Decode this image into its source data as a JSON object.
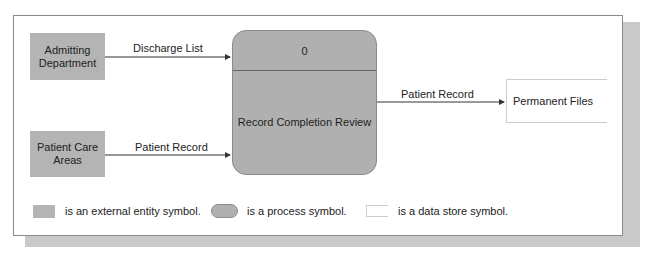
{
  "diagram": {
    "type": "data-flow-diagram",
    "external_entities": [
      {
        "id": "admitting",
        "label_line1": "Admitting",
        "label_line2": "Department"
      },
      {
        "id": "patient-care",
        "label_line1": "Patient Care",
        "label_line2": "Areas"
      }
    ],
    "process": {
      "number": "0",
      "name": "Record Completion Review"
    },
    "data_store": {
      "name": "Permanent Files"
    },
    "flows": [
      {
        "from": "Admitting Department",
        "to": "Record Completion Review",
        "label": "Discharge List"
      },
      {
        "from": "Patient Care Areas",
        "to": "Record Completion Review",
        "label": "Patient Record"
      },
      {
        "from": "Record Completion Review",
        "to": "Permanent Files",
        "label": "Patient Record"
      }
    ],
    "legend": [
      {
        "symbol": "external-entity",
        "text": "is an external entity symbol."
      },
      {
        "symbol": "process",
        "text": "is a process symbol."
      },
      {
        "symbol": "data-store",
        "text": "is a data store symbol."
      }
    ],
    "colors": {
      "entity_fill": "#b4b4b4",
      "process_fill": "#b0b0b0",
      "shadow": "#c9c9c9",
      "line": "#333333"
    }
  }
}
